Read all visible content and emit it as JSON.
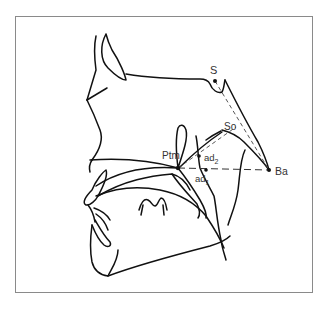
{
  "figure": {
    "type": "cephalometric tracing",
    "labels": {
      "S": "S",
      "So": "So",
      "Ptm": "Ptm",
      "Ba": "Ba",
      "ad2_base": "ad",
      "ad2_sub": "2",
      "ad1_base": "ad",
      "ad1_sub": "1"
    },
    "landmarks": [
      {
        "name": "S",
        "x": 215,
        "y": 81
      },
      {
        "name": "So",
        "x": 236,
        "y": 127
      },
      {
        "name": "Ptm",
        "x": 178,
        "y": 168
      },
      {
        "name": "ad2",
        "x": 199,
        "y": 156
      },
      {
        "name": "ad1",
        "x": 206,
        "y": 170
      },
      {
        "name": "Ba",
        "x": 269,
        "y": 170
      }
    ],
    "colors": {
      "line": "#111111",
      "frame": "#8a8a8a",
      "text": "#333333"
    }
  }
}
